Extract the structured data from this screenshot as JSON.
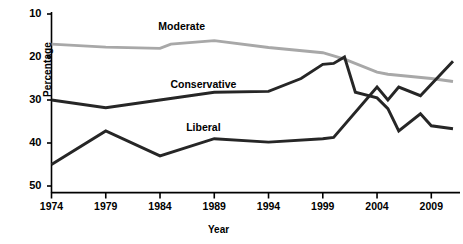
{
  "chart_data": {
    "type": "line",
    "title": "",
    "xlabel": "Year",
    "ylabel": "Percentage",
    "xlim": [
      1974,
      2011
    ],
    "ylim": [
      10,
      50
    ],
    "grid": false,
    "legend_position": "inline-annotations",
    "xticks": [
      1974,
      1979,
      1984,
      1989,
      1994,
      1999,
      2004,
      2009
    ],
    "yticks": [
      10,
      20,
      30,
      40,
      50
    ],
    "series": [
      {
        "name": "Moderate",
        "color": "#a8a8a8",
        "label_x": 1986,
        "label_y": 47,
        "points": [
          {
            "x": 1974,
            "y": 43
          },
          {
            "x": 1979,
            "y": 42.3
          },
          {
            "x": 1984,
            "y": 42
          },
          {
            "x": 1985,
            "y": 43
          },
          {
            "x": 1989,
            "y": 43.8
          },
          {
            "x": 1994,
            "y": 42.2
          },
          {
            "x": 1999,
            "y": 41
          },
          {
            "x": 2001,
            "y": 39.5
          },
          {
            "x": 2004,
            "y": 36.5
          },
          {
            "x": 2005,
            "y": 36
          },
          {
            "x": 2009,
            "y": 35
          },
          {
            "x": 2011,
            "y": 34.3
          }
        ]
      },
      {
        "name": "Conservative",
        "color": "#262626",
        "label_x": 1988,
        "label_y": 33.5,
        "points": [
          {
            "x": 1974,
            "y": 30
          },
          {
            "x": 1979,
            "y": 28.2
          },
          {
            "x": 1984,
            "y": 30
          },
          {
            "x": 1989,
            "y": 31.8
          },
          {
            "x": 1994,
            "y": 32
          },
          {
            "x": 1997,
            "y": 35
          },
          {
            "x": 1999,
            "y": 38.3
          },
          {
            "x": 2000,
            "y": 38.5
          },
          {
            "x": 2001,
            "y": 40
          },
          {
            "x": 2002,
            "y": 31.8
          },
          {
            "x": 2004,
            "y": 30.5
          },
          {
            "x": 2005,
            "y": 28
          },
          {
            "x": 2006,
            "y": 22.8
          },
          {
            "x": 2008,
            "y": 26.8
          },
          {
            "x": 2009,
            "y": 24
          },
          {
            "x": 2011,
            "y": 23.3
          }
        ]
      },
      {
        "name": "Liberal",
        "color": "#262626",
        "label_x": 1988,
        "label_y": 23.5,
        "points": [
          {
            "x": 1974,
            "y": 15
          },
          {
            "x": 1979,
            "y": 22.8
          },
          {
            "x": 1984,
            "y": 17
          },
          {
            "x": 1989,
            "y": 21
          },
          {
            "x": 1994,
            "y": 20.2
          },
          {
            "x": 1999,
            "y": 21
          },
          {
            "x": 2000,
            "y": 21.3
          },
          {
            "x": 2004,
            "y": 33
          },
          {
            "x": 2005,
            "y": 30
          },
          {
            "x": 2006,
            "y": 33
          },
          {
            "x": 2008,
            "y": 31
          },
          {
            "x": 2011,
            "y": 39
          }
        ]
      }
    ]
  },
  "axes": {
    "y_label": "Percentage",
    "x_label": "Year",
    "y_tick_labels": [
      "50",
      "40",
      "30",
      "20",
      "10"
    ],
    "x_tick_labels": [
      "1974",
      "1979",
      "1984",
      "1989",
      "1994",
      "1999",
      "2004",
      "2009"
    ]
  },
  "annotations": {
    "moderate": "Moderate",
    "conservative": "Conservative",
    "liberal": "Liberal"
  },
  "colors": {
    "moderate_line": "#a8a8a8",
    "dark_line": "#262626",
    "axis": "#000000",
    "background": "#ffffff"
  }
}
